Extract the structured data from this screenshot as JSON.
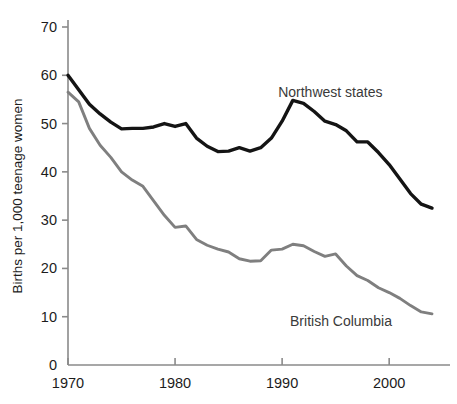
{
  "chart_data": {
    "type": "line",
    "title": "",
    "subtitle": "",
    "xlabel": "",
    "ylabel": "Births per 1,000 teenage women",
    "xlim": [
      1970,
      2004
    ],
    "ylim": [
      0,
      70
    ],
    "grid": false,
    "legend_position": "inline-annotation",
    "y_ticks": [
      0,
      10,
      20,
      30,
      40,
      50,
      60,
      70
    ],
    "y_tick_labels": [
      "0",
      "10",
      "20",
      "30",
      "40",
      "50",
      "60",
      "70"
    ],
    "x_ticks": [
      1970,
      1980,
      1990,
      2000
    ],
    "x_tick_labels": [
      "1970",
      "1980",
      "1990",
      "2000"
    ],
    "x": [
      1970,
      1971,
      1972,
      1973,
      1974,
      1975,
      1976,
      1977,
      1978,
      1979,
      1980,
      1981,
      1982,
      1983,
      1984,
      1985,
      1986,
      1987,
      1988,
      1989,
      1990,
      1991,
      1992,
      1993,
      1994,
      1995,
      1996,
      1997,
      1998,
      1999,
      2000,
      2001,
      2002,
      2003,
      2004
    ],
    "series": [
      {
        "name": "Northwest states",
        "color": "#141414",
        "label_x": 1994.5,
        "label_y": 55.5,
        "values": [
          60.0,
          57.0,
          54.0,
          52.0,
          50.3,
          48.9,
          49.0,
          49.0,
          49.3,
          50.0,
          49.4,
          50.0,
          47.0,
          45.3,
          44.2,
          44.3,
          45.0,
          44.3,
          45.0,
          47.0,
          50.5,
          54.8,
          54.2,
          52.5,
          50.5,
          49.8,
          48.5,
          46.2,
          46.2,
          44.0,
          41.5,
          38.5,
          35.5,
          33.3,
          32.5
        ]
      },
      {
        "name": "British Columbia",
        "color": "#7f7f7f",
        "label_x": 1995.5,
        "label_y": 8.0,
        "values": [
          56.5,
          54.5,
          49.0,
          45.5,
          43.0,
          40.0,
          38.3,
          37.0,
          34.0,
          31.0,
          28.5,
          28.8,
          26.0,
          24.8,
          24.0,
          23.4,
          22.0,
          21.5,
          21.6,
          23.8,
          24.0,
          25.0,
          24.7,
          23.5,
          22.5,
          23.0,
          20.5,
          18.5,
          17.5,
          16.0,
          15.0,
          13.8,
          12.3,
          11.0,
          10.6
        ]
      }
    ]
  },
  "axes": {
    "y_axis_title": "Births per 1,000 teenage women"
  }
}
